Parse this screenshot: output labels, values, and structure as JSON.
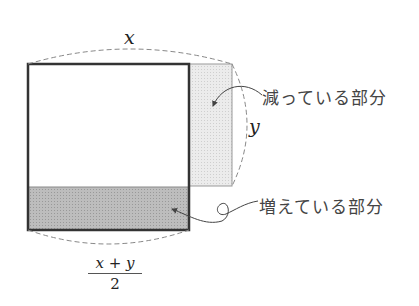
{
  "diagram": {
    "labels": {
      "top_width": "x",
      "right_height": "y",
      "bottom_fraction_numerator": "x + y",
      "bottom_fraction_denominator": "2",
      "decreasing_part": "減っている部分",
      "increasing_part": "増えている部分"
    },
    "colors": {
      "square_outline": "#333333",
      "decreasing_fill": "#e4e4e4",
      "increasing_fill": "#b8b8b8",
      "dashed_arc": "#888888"
    }
  }
}
